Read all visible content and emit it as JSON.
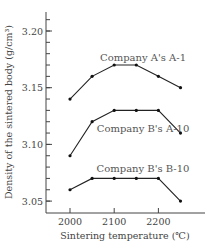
{
  "chart_data": {
    "type": "line",
    "title": "",
    "xlabel": "Sintering temperature (℃)",
    "ylabel": "Density of the sintered body (g/cm³)",
    "x": [
      2000,
      2050,
      2100,
      2150,
      2200,
      2250
    ],
    "x_ticks": [
      "2000",
      "2100",
      "2200"
    ],
    "y_ticks": [
      "3.05",
      "3.10",
      "3.15",
      "3.20"
    ],
    "xlim": [
      1980,
      2290
    ],
    "ylim": [
      3.04,
      3.22
    ],
    "grid": false,
    "legend_position": "inline labels above each line",
    "series": [
      {
        "name": "Company A's A-1",
        "values": [
          3.14,
          3.16,
          3.17,
          3.17,
          3.16,
          3.15
        ]
      },
      {
        "name": "Company B's A-10",
        "values": [
          3.09,
          3.12,
          3.13,
          3.13,
          3.13,
          3.11
        ]
      },
      {
        "name": "Company B's B-10",
        "values": [
          3.06,
          3.07,
          3.07,
          3.07,
          3.07,
          3.05
        ]
      }
    ]
  }
}
